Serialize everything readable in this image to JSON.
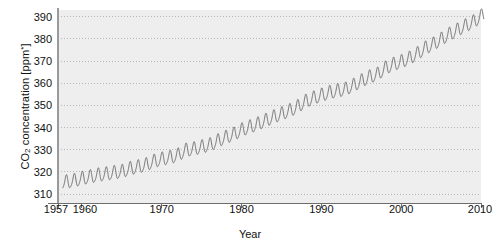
{
  "chart_data": {
    "type": "line",
    "title": "",
    "xlabel": "Year",
    "ylabel_parts": {
      "prefix": "CO",
      "sub": "2",
      "middle": " concentration [ppm",
      "sup": "*",
      "suffix": "]"
    },
    "ylabel": "CO2 concentration [ppm*]",
    "xlim": [
      1957,
      2010
    ],
    "ylim": [
      306,
      393
    ],
    "grid": true,
    "grid_style": "dotted",
    "legend": "none",
    "line_color": "#6f6f6f",
    "plot_bg": "#eeeeee",
    "grid_color": "#b8b8b8",
    "axis_color": "#8a8a8a",
    "text_color": "#111111",
    "xticks": [
      {
        "value": 1957,
        "label": "1957"
      },
      {
        "value": 1960,
        "label": "1960"
      },
      {
        "value": 1970,
        "label": "1970"
      },
      {
        "value": 1980,
        "label": "1980"
      },
      {
        "value": 1990,
        "label": "1990"
      },
      {
        "value": 2000,
        "label": "2000"
      },
      {
        "value": 2010,
        "label": "2010"
      }
    ],
    "yticks": [
      {
        "value": 310,
        "label": "310"
      },
      {
        "value": 320,
        "label": "320"
      },
      {
        "value": 330,
        "label": "330"
      },
      {
        "value": 340,
        "label": "340"
      },
      {
        "value": 350,
        "label": "350"
      },
      {
        "value": 360,
        "label": "360"
      },
      {
        "value": 370,
        "label": "370"
      },
      {
        "value": 380,
        "label": "380"
      },
      {
        "value": 390,
        "label": "390"
      }
    ],
    "series_name": "Mauna Loa atmospheric CO2 (Keeling Curve)",
    "seasonal_amplitude_ppm": 3.0,
    "seasonal_period_years": 1.0,
    "annual_mean": {
      "x": [
        1958,
        1959,
        1960,
        1961,
        1962,
        1963,
        1964,
        1965,
        1966,
        1967,
        1968,
        1969,
        1970,
        1971,
        1972,
        1973,
        1974,
        1975,
        1976,
        1977,
        1978,
        1979,
        1980,
        1981,
        1982,
        1983,
        1984,
        1985,
        1986,
        1987,
        1988,
        1989,
        1990,
        1991,
        1992,
        1993,
        1994,
        1995,
        1996,
        1997,
        1998,
        1999,
        2000,
        2001,
        2002,
        2003,
        2004,
        2005,
        2006,
        2007,
        2008,
        2009,
        2010
      ],
      "y": [
        315.3,
        315.9,
        316.9,
        317.6,
        318.4,
        318.9,
        319.5,
        320.0,
        321.3,
        322.1,
        323.0,
        324.6,
        325.6,
        326.3,
        327.4,
        329.6,
        330.2,
        331.1,
        332.0,
        333.8,
        335.4,
        336.8,
        338.7,
        340.1,
        341.4,
        343.0,
        344.6,
        346.0,
        347.4,
        349.2,
        351.6,
        353.1,
        354.4,
        355.6,
        356.4,
        357.1,
        358.8,
        360.8,
        362.6,
        363.8,
        366.6,
        368.3,
        369.5,
        371.0,
        373.1,
        375.6,
        377.4,
        379.6,
        381.8,
        383.7,
        385.6,
        387.4,
        389.9
      ]
    }
  },
  "axis_label_x": "Year"
}
